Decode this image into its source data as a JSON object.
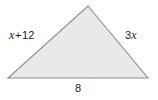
{
  "figure": {
    "type": "geometry-diagram",
    "shape": "triangle",
    "fill_color": "#e9e9e9",
    "stroke_color": "#8c8c8c",
    "background_color": "#ffffff",
    "vertices": {
      "apex": [
        88,
        6
      ],
      "bottom_left": [
        8,
        78
      ],
      "bottom_right": [
        148,
        78
      ]
    },
    "labels": {
      "left_side": {
        "full_text": "x + 12",
        "variable": "x",
        "operator": "+",
        "constant": "12"
      },
      "right_side": {
        "full_text": "3x",
        "coefficient": "3",
        "variable": "x"
      },
      "base": {
        "full_text": "8",
        "value": "8"
      }
    }
  }
}
